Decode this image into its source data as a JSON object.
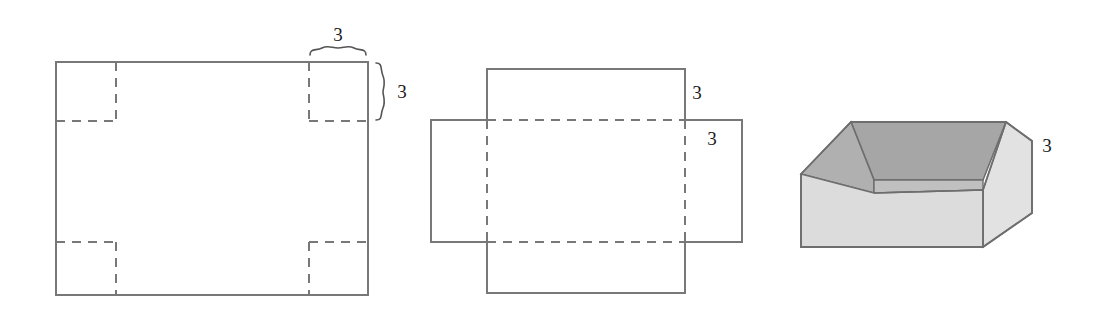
{
  "figure": {
    "background_color": "#ffffff",
    "stroke_color": "#787878",
    "label_color": "#1a1a1a",
    "panels": [
      {
        "name": "flat-sheet-with-corner-squares",
        "description": "Rectangle with dashed squares cut at each of the four corners",
        "labels": [
          "3",
          "3"
        ],
        "dimension_braces": [
          "horizontal-top-right",
          "vertical-right"
        ]
      },
      {
        "name": "unfolded-net",
        "description": "Net of an open box: base rectangle with four rectangular flaps folded along dashed lines",
        "labels": [
          "3",
          "3"
        ]
      },
      {
        "name": "assembled-open-box",
        "description": "Three dimensional open-top box",
        "labels": [
          "3"
        ]
      }
    ]
  },
  "labels": {
    "sheet_corner_width": "3",
    "sheet_corner_height": "3",
    "net_flap_top": "3",
    "net_flap_right": "3",
    "box_height": "3"
  },
  "colors": {
    "stroke": "#787878",
    "stroke_dark": "#6e6e6e",
    "box_interior_back": "#a6a6a6",
    "box_interior_left": "#b5b5b5",
    "box_rim_top": "#c9c9c9",
    "box_front_face": "#dcdcdc",
    "box_right_face": "#e2e2e2",
    "box_floor": "#d2d2d2",
    "label_text": "#1a1a1a",
    "page_background": "#ffffff"
  },
  "geometry": {
    "sheet": {
      "x": 56,
      "y": 62,
      "width": 312,
      "height": 233,
      "corner_inset": 60
    },
    "net": {
      "base_x": 487,
      "base_y": 120,
      "base_width": 198,
      "base_height": 122,
      "flap_top_height": 51,
      "flap_bottom_height": 51,
      "flap_left_width": 56,
      "flap_right_width": 57
    },
    "box": {
      "left": 801,
      "right": 1032,
      "top": 120,
      "bottom": 247
    }
  }
}
